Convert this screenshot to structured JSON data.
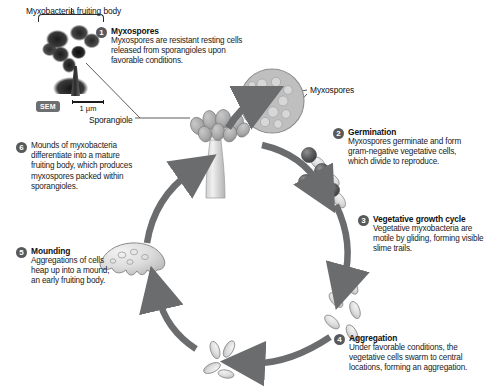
{
  "figure": {
    "caption_top": "Myxobacteria fruiting body",
    "sem_label": "SEM",
    "scale_value": "1 µm",
    "sporangiole_label": "Sporangiole",
    "myxospores_label": "Myxospores"
  },
  "steps": [
    {
      "number": "1",
      "title": "Myxospores",
      "body": "Myxospores are resistant resting cells released from sporangioles upon favorable conditions."
    },
    {
      "number": "2",
      "title": "Germination",
      "body": "Myxospores germinate and form gram-negative vegetative cells, which divide to reproduce."
    },
    {
      "number": "3",
      "title": "Vegetative growth cycle",
      "body": "Vegetative myxobacteria are motile by gliding, forming visible slime trails."
    },
    {
      "number": "4",
      "title": "Aggregation",
      "body": "Under favorable conditions, the vegetative cells swarm to central locations, forming an aggregation."
    },
    {
      "number": "5",
      "title": "Mounding",
      "body": "Aggregations of cells heap up into a mound, an early fruiting body."
    },
    {
      "number": "6",
      "title": "",
      "body": "Mounds of myxobacteria differentiate into a mature fruiting body, which produces myxospores packed within sporangioles."
    }
  ],
  "colors": {
    "badge": "#58595b",
    "arrow": "#6b6c6e",
    "cell_fill": "#d9d9d9",
    "cell_stroke": "#8a8a8a",
    "text": "#1a1a1a",
    "background": "#ffffff"
  },
  "diagram": {
    "type": "life-cycle",
    "organism": "Myxobacteria",
    "stage_order": [
      "Myxospores",
      "Germination",
      "Vegetative growth cycle",
      "Aggregation",
      "Mounding",
      "Fruiting body"
    ],
    "cycle_direction": "clockwise"
  }
}
